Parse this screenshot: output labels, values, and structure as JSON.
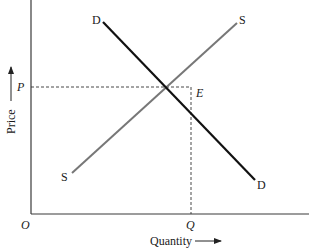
{
  "diagram": {
    "type": "supply-demand",
    "axes": {
      "x_label": "Quantity",
      "y_label": "Price",
      "origin_label": "O"
    },
    "curves": {
      "demand": {
        "label_top": "D",
        "label_bottom": "D",
        "color": "#111111"
      },
      "supply": {
        "label_top": "S",
        "label_bottom": "S",
        "color": "#777777"
      }
    },
    "equilibrium": {
      "point_label": "E",
      "price_label": "P",
      "quantity_label": "Q"
    }
  }
}
